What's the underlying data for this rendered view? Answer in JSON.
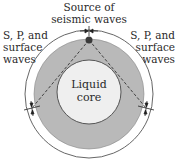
{
  "labels": {
    "source": [
      "Source of",
      "seismic waves"
    ],
    "left_waves": [
      "S, P, and",
      "surface",
      "waves"
    ],
    "right_waves": [
      "S, P, and",
      "surface",
      "waves"
    ],
    "core": [
      "Liquid",
      "core"
    ]
  },
  "colors": {
    "mantle": "#b9b9b9",
    "core": "#efefef",
    "outline": "#555555",
    "dashed": "#333333",
    "source_dot": "#3a3a3a"
  }
}
